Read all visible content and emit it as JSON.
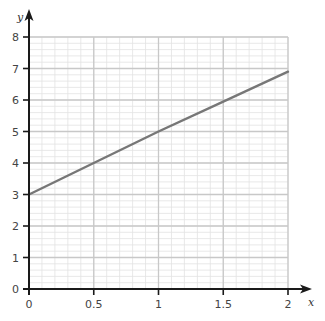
{
  "chart_data": {
    "type": "line",
    "title": "",
    "xlabel": "x",
    "ylabel": "y",
    "xlim": [
      0,
      2
    ],
    "ylim": [
      0,
      8
    ],
    "x_ticks": [
      "0",
      "0.5",
      "1",
      "1.5",
      "2"
    ],
    "y_ticks": [
      "0",
      "1",
      "2",
      "3",
      "4",
      "5",
      "6",
      "7",
      "8"
    ],
    "grid": true,
    "grid_style": "graph paper: major lines every 0.5 (x) / 1 (y), minor lines every 0.1 (x) / 0.2 (y)",
    "legend": null,
    "series": [
      {
        "name": "line",
        "x": [
          0,
          0.5,
          1,
          1.5,
          2
        ],
        "y": [
          3,
          4,
          5,
          5.95,
          6.9
        ],
        "color": "#777777"
      }
    ]
  },
  "colors": {
    "axis": "#1a1a1a",
    "major_grid": "#c8c8c8",
    "minor_grid": "#e2e2e2",
    "line": "#777777"
  }
}
